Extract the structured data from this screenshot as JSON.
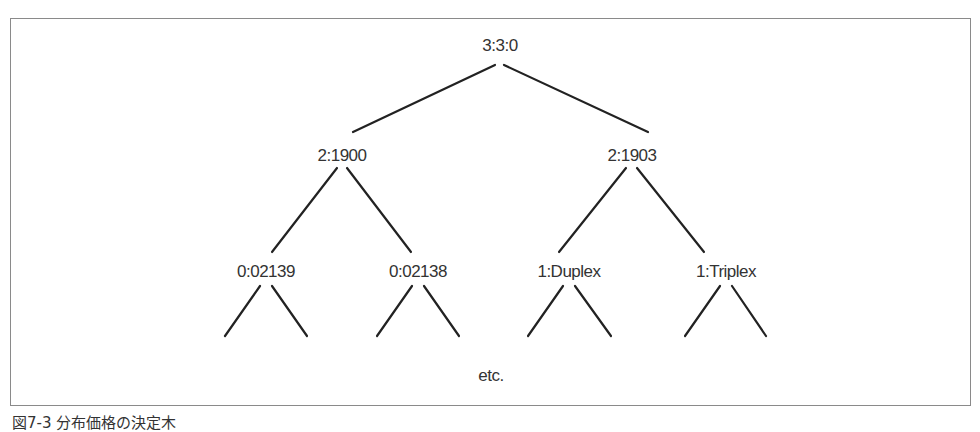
{
  "figure": {
    "caption": "図7-3 分布価格の決定木",
    "line_color": "#222222",
    "frame_color": "#8a8a8a"
  },
  "tree": {
    "root": {
      "label": "3:3:0",
      "x": 500,
      "y": 50
    },
    "level1": [
      {
        "label": "2:1900",
        "x": 342,
        "y": 157
      },
      {
        "label": "2:1903",
        "x": 632,
        "y": 157
      }
    ],
    "level2": [
      {
        "label": "0:02139",
        "x": 266,
        "y": 272
      },
      {
        "label": "0:02138",
        "x": 418,
        "y": 272
      },
      {
        "label": "1:Duplex",
        "x": 569,
        "y": 272
      },
      {
        "label": "1:Triplex",
        "x": 726,
        "y": 272
      }
    ],
    "continuation": {
      "label": "etc.",
      "x": 491,
      "y": 376
    }
  }
}
